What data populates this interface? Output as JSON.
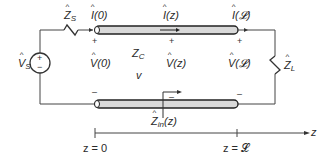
{
  "diagram": {
    "type": "transmission-line-circuit",
    "source": {
      "label": "V",
      "subscript": "S",
      "plus": "+",
      "minus": "−"
    },
    "source_impedance": {
      "label": "Z",
      "subscript": "S"
    },
    "load_impedance": {
      "label": "Z",
      "subscript": "L"
    },
    "line": {
      "characteristic_impedance": "Z",
      "characteristic_subscript": "C",
      "velocity": "v"
    },
    "currents": [
      {
        "label": "I",
        "arg": "(0)"
      },
      {
        "label": "I",
        "arg": "(z)"
      },
      {
        "label": "I",
        "arg": "(𝓛)"
      }
    ],
    "voltages": [
      {
        "label": "V",
        "arg": "(0)"
      },
      {
        "label": "V",
        "arg": "(z)"
      },
      {
        "label": "V",
        "arg": "(𝓛)"
      }
    ],
    "input_impedance": {
      "label": "Z",
      "subscript": "in",
      "arg": "(z)"
    },
    "polarity": {
      "plus": "+",
      "minus": "–"
    },
    "axis": {
      "variable": "z",
      "start_label": "z = 0",
      "end_label": "z = 𝓛"
    }
  }
}
